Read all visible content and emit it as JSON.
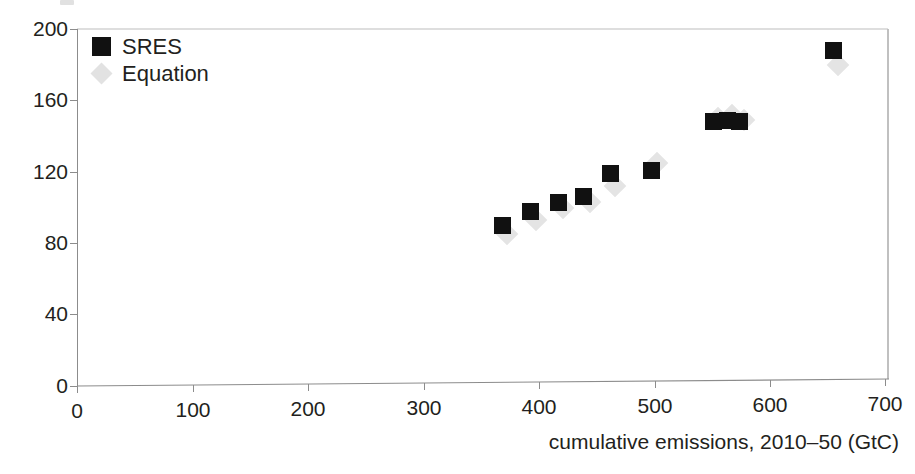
{
  "figure": {
    "axis_title": "cumulative emissions, 2010–50 (GtC)"
  },
  "legend": {
    "items": [
      {
        "label": "SRES",
        "marker": "filled-square-marker",
        "color": "#111111"
      },
      {
        "label": "Equation",
        "marker": "light-diamond-marker",
        "color": "#e4e4e4"
      }
    ]
  },
  "axes": {
    "x": {
      "label": "cumulative emissions, 2010–50 (GtC)",
      "ticks": [
        "0",
        "100",
        "200",
        "300",
        "400",
        "500",
        "600",
        "700"
      ]
    },
    "y": {
      "label": "",
      "ticks": [
        "0",
        "40",
        "80",
        "120",
        "160",
        "200"
      ]
    }
  },
  "chart_data": {
    "type": "scatter",
    "title": "",
    "subtitle": "",
    "xlabel": "cumulative emissions, 2010–50 (GtC)",
    "ylabel": "",
    "xlim": [
      0,
      700
    ],
    "ylim": [
      0,
      200
    ],
    "xticks": [
      0,
      100,
      200,
      300,
      400,
      500,
      600,
      700
    ],
    "yticks": [
      0,
      40,
      80,
      120,
      160,
      200
    ],
    "grid": false,
    "legend_position": "top-left inside plot",
    "series": [
      {
        "name": "SRES",
        "marker": "square",
        "color": "#111111",
        "points": [
          [
            367,
            90
          ],
          [
            391,
            98
          ],
          [
            415,
            103
          ],
          [
            437,
            106
          ],
          [
            460,
            119
          ],
          [
            495,
            121
          ],
          [
            549,
            148
          ],
          [
            561,
            149
          ],
          [
            571,
            148
          ],
          [
            652,
            188
          ]
        ]
      },
      {
        "name": "Equation",
        "marker": "diamond",
        "color": "#e4e4e4",
        "points": [
          [
            371,
            85
          ],
          [
            396,
            93
          ],
          [
            419,
            100
          ],
          [
            442,
            103
          ],
          [
            464,
            112
          ],
          [
            500,
            125
          ],
          [
            553,
            150
          ],
          [
            565,
            152
          ],
          [
            575,
            149
          ],
          [
            656,
            180
          ]
        ]
      }
    ]
  }
}
